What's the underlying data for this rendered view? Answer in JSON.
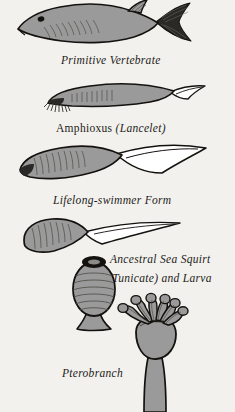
{
  "plate": {
    "background_color": "#f2f1ed",
    "body_fill": "#9a9a9a",
    "dark_fill": "#2b2926",
    "outline_color": "#14120f",
    "highlight_fill": "#ffffff",
    "text_color": "#1d1b19"
  },
  "figures": [
    {
      "id": "primitive-vertebrate",
      "icon": "fish-figure",
      "caption_lines": [
        {
          "text": "Primitive Vertebrate",
          "style": "italic"
        }
      ]
    },
    {
      "id": "amphioxus",
      "icon": "amphioxus-figure",
      "caption_lines": [
        {
          "text": "Amphioxus ",
          "style": "roman"
        },
        {
          "text": "(Lancelet)",
          "style": "italic"
        }
      ]
    },
    {
      "id": "lifelong-swimmer",
      "icon": "lifelong-swimmer-figure",
      "caption_lines": [
        {
          "text": "Lifelong-swimmer Form",
          "style": "italic"
        }
      ]
    },
    {
      "id": "sea-squirt-larva",
      "icon": "tadpole-larva-figure",
      "caption_lines": [
        {
          "text": "Ancestral Sea Squirt",
          "style": "italic"
        },
        {
          "text": "(Tunicate) and Larva",
          "style": "italic"
        }
      ]
    },
    {
      "id": "sea-squirt-adult",
      "icon": "sea-squirt-figure",
      "caption_lines": []
    },
    {
      "id": "pterobranch",
      "icon": "pterobranch-figure",
      "caption_lines": [
        {
          "text": "Pterobranch",
          "style": "italic"
        }
      ]
    }
  ],
  "captions": {
    "primitive_vertebrate": "Primitive Vertebrate",
    "amphioxus_name": "Amphioxus",
    "amphioxus_common": "(Lancelet)",
    "lifelong_swimmer": "Lifelong-swimmer Form",
    "sea_squirt_line1": "Ancestral Sea Squirt",
    "sea_squirt_line2": "(Tunicate) and Larva",
    "pterobranch": "Pterobranch"
  }
}
